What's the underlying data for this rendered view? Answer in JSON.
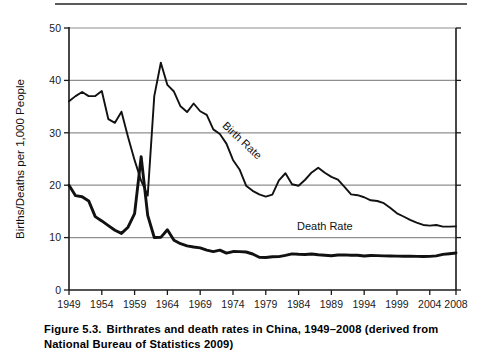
{
  "figure": {
    "caption_number": "Figure 5.3.",
    "caption_text": "Birthrates and death rates in China, 1949–2008 (derived from National Bureau of Statistics 2009)"
  },
  "chart_data": {
    "type": "line",
    "title": "",
    "xlabel": "",
    "ylabel": "Births/Deaths per 1,000 People",
    "xlim": [
      1949,
      2008
    ],
    "ylim": [
      0,
      50
    ],
    "grid": true,
    "grid_axis": "y",
    "legend_position": "inline-annotation",
    "xticks": [
      1949,
      1954,
      1959,
      1964,
      1969,
      1974,
      1979,
      1984,
      1989,
      1994,
      1999,
      2004,
      2008
    ],
    "xtick_labels": [
      "1949",
      "1954",
      "1959",
      "1964",
      "1969",
      "1974",
      "1979",
      "1984",
      "1989",
      "1994",
      "1999",
      "2004",
      "2008"
    ],
    "yticks": [
      0,
      10,
      20,
      30,
      40,
      50
    ],
    "ytick_labels": [
      "0",
      "10",
      "20",
      "30",
      "40",
      "50"
    ],
    "annotations": [
      {
        "text": "Birth Rate",
        "x": 1975,
        "y": 28,
        "rotation": 43
      },
      {
        "text": "Death Rate",
        "x": 1988,
        "y": 11.5,
        "rotation": 0
      }
    ],
    "x": [
      1949,
      1950,
      1951,
      1952,
      1953,
      1954,
      1955,
      1956,
      1957,
      1958,
      1959,
      1960,
      1961,
      1962,
      1963,
      1964,
      1965,
      1966,
      1967,
      1968,
      1969,
      1970,
      1971,
      1972,
      1973,
      1974,
      1975,
      1976,
      1977,
      1978,
      1979,
      1980,
      1981,
      1982,
      1983,
      1984,
      1985,
      1986,
      1987,
      1988,
      1989,
      1990,
      1991,
      1992,
      1993,
      1994,
      1995,
      1996,
      1997,
      1998,
      1999,
      2000,
      2001,
      2002,
      2003,
      2004,
      2005,
      2006,
      2007,
      2008
    ],
    "series": [
      {
        "name": "Birth Rate",
        "values": [
          36.0,
          37.0,
          37.8,
          37.0,
          37.0,
          37.97,
          32.6,
          31.9,
          34.03,
          29.22,
          24.78,
          20.86,
          18.02,
          37.01,
          43.37,
          39.14,
          37.88,
          35.05,
          33.96,
          35.59,
          34.11,
          33.43,
          30.65,
          29.77,
          27.93,
          24.82,
          23.01,
          19.91,
          18.93,
          18.25,
          17.82,
          18.21,
          20.91,
          22.28,
          20.19,
          19.9,
          21.04,
          22.43,
          23.33,
          22.37,
          21.58,
          21.06,
          19.68,
          18.24,
          18.09,
          17.7,
          17.12,
          16.98,
          16.57,
          15.64,
          14.64,
          14.03,
          13.38,
          12.86,
          12.41,
          12.29,
          12.4,
          12.09,
          12.1,
          12.14
        ]
      },
      {
        "name": "Death Rate",
        "values": [
          20.0,
          18.0,
          17.8,
          17.0,
          14.0,
          13.18,
          12.28,
          11.4,
          10.8,
          11.98,
          14.59,
          25.43,
          14.24,
          10.02,
          10.04,
          11.5,
          9.5,
          8.83,
          8.43,
          8.21,
          8.03,
          7.6,
          7.32,
          7.61,
          7.04,
          7.34,
          7.32,
          7.25,
          6.87,
          6.25,
          6.21,
          6.34,
          6.36,
          6.6,
          6.9,
          6.82,
          6.78,
          6.86,
          6.72,
          6.64,
          6.54,
          6.67,
          6.7,
          6.64,
          6.64,
          6.49,
          6.57,
          6.56,
          6.51,
          6.5,
          6.46,
          6.45,
          6.43,
          6.41,
          6.4,
          6.42,
          6.51,
          6.81,
          6.93,
          7.06
        ]
      }
    ]
  },
  "axes_geometry": {
    "plot_left": 69,
    "plot_right": 456,
    "plot_top": 28,
    "plot_bottom": 290
  }
}
